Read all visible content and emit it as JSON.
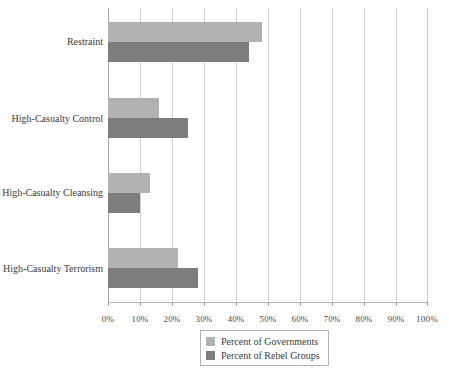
{
  "chart_data": {
    "type": "bar",
    "orientation": "horizontal",
    "title": "",
    "subtitle": "",
    "xlabel": "",
    "ylabel": "",
    "categories": [
      "Restraint",
      "High-Casualty Control",
      "High-Casualty Cleansing",
      "High-Casualty Terrorism"
    ],
    "series": [
      {
        "name": "Percent of  Governments",
        "color": "#b2b2b2",
        "values": [
          48,
          16,
          13,
          22
        ]
      },
      {
        "name": "Percent of  Rebel Groups",
        "color": "#7d7d7d",
        "values": [
          44,
          25,
          10,
          28
        ]
      }
    ],
    "xlim": [
      0,
      100
    ],
    "xticks": [
      0,
      10,
      20,
      30,
      40,
      50,
      60,
      70,
      80,
      90,
      100
    ],
    "xtick_labels": [
      "0%",
      "10%",
      "20%",
      "30%",
      "40%",
      "50%",
      "60%",
      "70%",
      "80%",
      "90%",
      "100%"
    ],
    "grid": true,
    "grid_axis": "x",
    "legend_position": "bottom-center",
    "legend": [
      "Percent of  Governments",
      "Percent of  Rebel Groups"
    ]
  },
  "colors": {
    "governments": "#b2b2b2",
    "rebel_groups": "#7d7d7d",
    "gridline": "#d2d2d2",
    "axis": "#a9a9a9",
    "background": "#ffffff",
    "text": "#3b3b3b"
  }
}
